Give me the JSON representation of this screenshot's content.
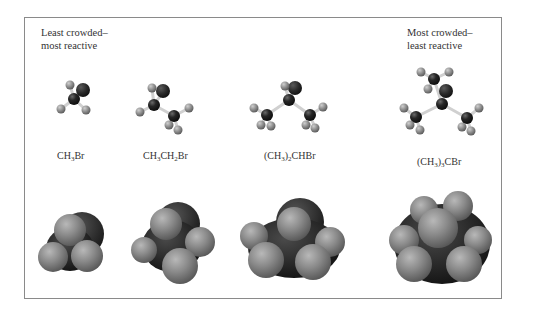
{
  "figure": {
    "annotations": {
      "left": {
        "line1": "Least crowded–",
        "line2": "most reactive"
      },
      "right": {
        "line1": "Most crowded–",
        "line2": "least reactive"
      }
    },
    "molecules": [
      {
        "formula_parts": [
          "CH",
          "3",
          "Br"
        ],
        "formula": "CH3Br"
      },
      {
        "formula_parts": [
          "CH",
          "3",
          "CH",
          "2",
          "Br"
        ],
        "formula": "CH3CH2Br"
      },
      {
        "formula_parts": [
          "(CH",
          "3",
          ")",
          "2",
          "CHBr"
        ],
        "formula": "(CH3)2CHBr"
      },
      {
        "formula_parts": [
          "(CH",
          "3",
          ")",
          "3",
          "CBr"
        ],
        "formula": "(CH3)3CBr"
      }
    ],
    "colors": {
      "frame_border": "#8a8a8a",
      "carbon": "#1e1e1e",
      "bromine": "#2b2b2b",
      "hydrogen": "#9a9a9a",
      "bond": "#cfcfcf"
    }
  }
}
